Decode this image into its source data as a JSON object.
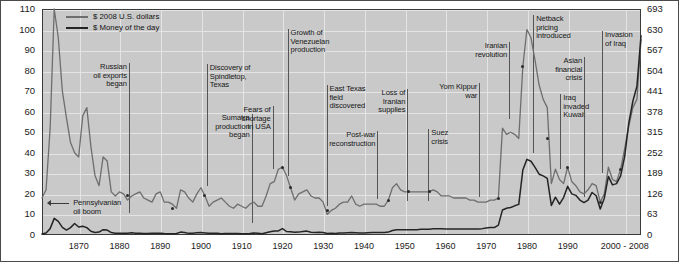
{
  "legend": {
    "position": "top-left-inside",
    "items": [
      {
        "label": "$ 2008 U.S. dollars",
        "color": "#6e6e6e"
      },
      {
        "label": "$ Money of the day",
        "color": "#242424"
      }
    ]
  },
  "chart_data": {
    "type": "line",
    "title": "",
    "xlabel": "",
    "ylabel": "",
    "grid": true,
    "xlim": [
      1861,
      2008
    ],
    "ylim": [
      0,
      110
    ],
    "ylim_right": [
      0,
      693
    ],
    "left_axis": {
      "ticks": [
        0,
        10,
        20,
        30,
        40,
        50,
        60,
        70,
        80,
        90,
        100,
        110
      ],
      "unit": "$ per barrel (2008 U.S. dollars)"
    },
    "right_axis": {
      "ticks": [
        0,
        63,
        126,
        189,
        252,
        315,
        378,
        441,
        504,
        567,
        630,
        693
      ],
      "unit": "index"
    },
    "x_tick_labels": [
      "1870",
      "1880",
      "1890",
      "1900",
      "1910",
      "1920",
      "1930",
      "1940",
      "1950",
      "1960",
      "1970",
      "1980",
      "1990",
      "2000 - 2008"
    ],
    "x_tick_values": [
      1870,
      1880,
      1890,
      1900,
      1910,
      1920,
      1930,
      1940,
      1950,
      1960,
      1970,
      1980,
      1990,
      2004
    ],
    "series": [
      {
        "name": "$ 2008 U.S. dollars",
        "color": "#6e6e6e",
        "x": [
          1861,
          1862,
          1863,
          1864,
          1865,
          1866,
          1867,
          1868,
          1869,
          1870,
          1871,
          1872,
          1873,
          1874,
          1875,
          1876,
          1877,
          1878,
          1879,
          1880,
          1881,
          1882,
          1883,
          1884,
          1885,
          1886,
          1887,
          1888,
          1889,
          1890,
          1891,
          1892,
          1893,
          1894,
          1895,
          1896,
          1897,
          1898,
          1899,
          1900,
          1901,
          1902,
          1903,
          1904,
          1905,
          1906,
          1907,
          1908,
          1909,
          1910,
          1911,
          1912,
          1913,
          1914,
          1915,
          1916,
          1917,
          1918,
          1919,
          1920,
          1921,
          1922,
          1923,
          1924,
          1925,
          1926,
          1927,
          1928,
          1929,
          1930,
          1931,
          1932,
          1933,
          1934,
          1935,
          1936,
          1937,
          1938,
          1939,
          1940,
          1941,
          1942,
          1943,
          1944,
          1945,
          1946,
          1947,
          1948,
          1949,
          1950,
          1951,
          1952,
          1953,
          1954,
          1955,
          1956,
          1957,
          1958,
          1959,
          1960,
          1961,
          1962,
          1963,
          1964,
          1965,
          1966,
          1967,
          1968,
          1969,
          1970,
          1971,
          1972,
          1973,
          1974,
          1975,
          1976,
          1977,
          1978,
          1979,
          1980,
          1981,
          1982,
          1983,
          1984,
          1985,
          1986,
          1987,
          1988,
          1989,
          1990,
          1991,
          1992,
          1993,
          1994,
          1995,
          1996,
          1997,
          1998,
          1999,
          2000,
          2001,
          2002,
          2003,
          2004,
          2005,
          2006,
          2007,
          2008
        ],
        "y": [
          18,
          22,
          52,
          110,
          96,
          70,
          57,
          45,
          40,
          38,
          58,
          62,
          43,
          29,
          24,
          38,
          36,
          21,
          19,
          21,
          20,
          17,
          19,
          20,
          21,
          18,
          17,
          16,
          20,
          21,
          16,
          16,
          15,
          13,
          22,
          21,
          18,
          16,
          20,
          23,
          19,
          14,
          16,
          17,
          18,
          16,
          14,
          13,
          15,
          14,
          13,
          15,
          16,
          14,
          14,
          19,
          25,
          26,
          32,
          33,
          29,
          23,
          17,
          20,
          21,
          22,
          19,
          18,
          18,
          16,
          10,
          12,
          13,
          15,
          16,
          16,
          19,
          15,
          14,
          15,
          15,
          15,
          15,
          14,
          14,
          17,
          23,
          25,
          22,
          21,
          21,
          21,
          21,
          21,
          21,
          21,
          22,
          21,
          19,
          19,
          19,
          18,
          18,
          18,
          18,
          17,
          17,
          16,
          16,
          16,
          17,
          17,
          18,
          52,
          49,
          50,
          49,
          47,
          82,
          100,
          96,
          85,
          73,
          66,
          62,
          25,
          32,
          27,
          25,
          33,
          26,
          24,
          21,
          20,
          22,
          25,
          24,
          16,
          20,
          33,
          27,
          26,
          32,
          42,
          53,
          62,
          66,
          95
        ],
        "peaks": {
          "1864": 110,
          "1872": 62,
          "1920": 33,
          "1980": 100,
          "2008": 95
        }
      },
      {
        "name": "$ Money of the day",
        "color": "#242424",
        "x": [
          1861,
          1862,
          1863,
          1864,
          1865,
          1866,
          1867,
          1868,
          1869,
          1870,
          1871,
          1872,
          1873,
          1874,
          1875,
          1876,
          1877,
          1878,
          1879,
          1880,
          1881,
          1882,
          1883,
          1884,
          1885,
          1886,
          1887,
          1888,
          1889,
          1890,
          1891,
          1892,
          1893,
          1894,
          1895,
          1896,
          1897,
          1898,
          1899,
          1900,
          1901,
          1902,
          1903,
          1904,
          1905,
          1906,
          1907,
          1908,
          1909,
          1910,
          1911,
          1912,
          1913,
          1914,
          1915,
          1916,
          1917,
          1918,
          1919,
          1920,
          1921,
          1922,
          1923,
          1924,
          1925,
          1926,
          1927,
          1928,
          1929,
          1930,
          1931,
          1932,
          1933,
          1934,
          1935,
          1936,
          1937,
          1938,
          1939,
          1940,
          1941,
          1942,
          1943,
          1944,
          1945,
          1946,
          1947,
          1948,
          1949,
          1950,
          1951,
          1952,
          1953,
          1954,
          1955,
          1956,
          1957,
          1958,
          1959,
          1960,
          1961,
          1962,
          1963,
          1964,
          1965,
          1966,
          1967,
          1968,
          1969,
          1970,
          1971,
          1972,
          1973,
          1974,
          1975,
          1976,
          1977,
          1978,
          1979,
          1980,
          1981,
          1982,
          1983,
          1984,
          1985,
          1986,
          1987,
          1988,
          1989,
          1990,
          1991,
          1992,
          1993,
          1994,
          1995,
          1996,
          1997,
          1998,
          1999,
          2000,
          2001,
          2002,
          2003,
          2004,
          2005,
          2006,
          2007,
          2008
        ],
        "y": [
          0.5,
          1.0,
          3.1,
          8.1,
          6.6,
          3.7,
          2.4,
          3.6,
          5.6,
          3.9,
          4.3,
          3.6,
          1.8,
          1.2,
          1.4,
          2.6,
          2.4,
          1.2,
          0.9,
          0.9,
          0.9,
          0.8,
          1.1,
          0.8,
          0.9,
          0.7,
          0.7,
          0.9,
          0.9,
          0.9,
          0.7,
          0.6,
          0.6,
          0.7,
          1.4,
          1.2,
          0.8,
          0.9,
          1.1,
          1.2,
          1.0,
          0.8,
          0.9,
          0.9,
          0.6,
          0.7,
          0.7,
          0.7,
          0.7,
          0.6,
          0.6,
          0.7,
          1.0,
          0.8,
          0.6,
          1.1,
          1.6,
          2.0,
          2.0,
          3.1,
          1.7,
          1.6,
          1.3,
          1.4,
          1.7,
          1.9,
          1.3,
          1.2,
          1.3,
          1.2,
          0.7,
          0.9,
          0.7,
          1.0,
          1.0,
          1.1,
          1.2,
          1.1,
          1.0,
          1.0,
          1.1,
          1.2,
          1.2,
          1.2,
          1.2,
          1.4,
          2.2,
          2.6,
          2.5,
          2.5,
          2.5,
          2.5,
          2.6,
          2.8,
          2.8,
          2.8,
          3.0,
          3.0,
          3.0,
          2.9,
          2.9,
          2.9,
          2.9,
          2.9,
          2.9,
          2.9,
          2.9,
          2.9,
          3.1,
          3.4,
          3.6,
          3.6,
          4.8,
          12.2,
          13.0,
          13.4,
          14.2,
          14.9,
          31.6,
          36.8,
          35.9,
          32.9,
          29.6,
          28.8,
          27.6,
          14.4,
          18.4,
          15.0,
          18.2,
          23.7,
          20.0,
          19.3,
          17.0,
          15.8,
          17.0,
          20.7,
          19.1,
          12.7,
          17.9,
          28.5,
          24.4,
          25.0,
          28.8,
          38.3,
          54.5,
          65.1,
          72.4,
          97.0
        ],
        "peaks": {
          "1980": 36.8,
          "2008": 97.0
        }
      }
    ],
    "annotations": [
      {
        "id": "pennsylvanian-oil-boom",
        "text": "Pennsylvanian\noil boom",
        "year": 1862,
        "align": "left",
        "style": "arrow",
        "x_pct": 4.7,
        "y_px": 198,
        "arrow_x_pct": 1.5,
        "arrow_y_px": 202
      },
      {
        "id": "russian-oil-exports-began",
        "text": "Russian\noil exports\nbegan",
        "year": 1882,
        "align": "right",
        "x_pct": 14.5,
        "y_px": 62,
        "leader_top": 62,
        "leader_bottom": 212
      },
      {
        "id": "sumatra-production-began",
        "text": "Sumatra\nproduction\nbegan",
        "year": 1893,
        "align": "right",
        "x_pct": 35.0,
        "y_px": 113,
        "leader_top": 113,
        "leader_bottom": 222
      },
      {
        "id": "discovery-of-spindletop-texas",
        "text": "Discovery of\nSpindletop,\nTexas",
        "year": 1901,
        "align": "left",
        "x_pct": 27.5,
        "y_px": 63,
        "leader_top": 63,
        "leader_bottom": 185
      },
      {
        "id": "fears-of-shortage-in-usa",
        "text": "Fears of\nshortage\nin USA",
        "year": 1920,
        "align": "right",
        "x_pct": 38.5,
        "y_px": 105,
        "leader_top": 105,
        "leader_bottom": 168
      },
      {
        "id": "growth-of-venezuelan-production",
        "text": "Growth of\nVenezuelan\nproduction",
        "year": 1922,
        "align": "left",
        "x_pct": 41.0,
        "y_px": 28,
        "leader_top": 28,
        "leader_bottom": 175
      },
      {
        "id": "east-texas-field-discovered",
        "text": "East Texas\nfield\ndiscovered",
        "year": 1931,
        "align": "left",
        "x_pct": 47.5,
        "y_px": 84,
        "leader_top": 84,
        "leader_bottom": 205
      },
      {
        "id": "post-war-reconstruction",
        "text": "Post-war\nreconstruction",
        "year": 1946,
        "align": "right",
        "x_pct": 56.0,
        "y_px": 130,
        "leader_top": 130,
        "leader_bottom": 198
      },
      {
        "id": "loss-of-iranian-supplies",
        "text": "Loss of\nIranian\nsupplies",
        "year": 1951,
        "align": "right",
        "x_pct": 61.0,
        "y_px": 88,
        "leader_top": 88,
        "leader_bottom": 200
      },
      {
        "id": "suez-crisis",
        "text": "Suez\ncrisis",
        "year": 1956,
        "align": "left",
        "x_pct": 64.5,
        "y_px": 128,
        "leader_top": 128,
        "leader_bottom": 200
      },
      {
        "id": "yom-kippur-war",
        "text": "Yom Kippur\nwar",
        "year": 1973,
        "align": "right",
        "x_pct": 73.0,
        "y_px": 82,
        "leader_top": 82,
        "leader_bottom": 196
      },
      {
        "id": "iranian-revolution",
        "text": "Iranian\nrevolution",
        "year": 1979,
        "align": "right",
        "x_pct": 78.0,
        "y_px": 41,
        "leader_top": 41,
        "leader_bottom": 118
      },
      {
        "id": "netback-pricing-introduced",
        "text": "Netback\npricing\nintroduced",
        "year": 1985,
        "align": "left",
        "x_pct": 82.0,
        "y_px": 14,
        "leader_top": 14,
        "leader_bottom": 152
      },
      {
        "id": "iraq-invaded-kuwait",
        "text": "Iraq\ninvaded\nKuwait",
        "year": 1990,
        "align": "left",
        "x_pct": 86.5,
        "y_px": 93,
        "leader_top": 93,
        "leader_bottom": 168
      },
      {
        "id": "asian-financial-crisis",
        "text": "Asian\nfinancial\ncrisis",
        "year": 1998,
        "align": "right",
        "x_pct": 90.5,
        "y_px": 56,
        "leader_top": 56,
        "leader_bottom": 196
      },
      {
        "id": "invasion-of-iraq",
        "text": "Invasion\nof Iraq",
        "year": 2003,
        "align": "left",
        "x_pct": 93.5,
        "y_px": 30,
        "leader_top": 30,
        "leader_bottom": 172
      }
    ],
    "markers": [
      {
        "year": 1882,
        "value": 19
      },
      {
        "year": 1893,
        "value": 13
      },
      {
        "year": 1901,
        "value": 19
      },
      {
        "year": 1920,
        "value": 33
      },
      {
        "year": 1922,
        "value": 23
      },
      {
        "year": 1931,
        "value": 12
      },
      {
        "year": 1946,
        "value": 17
      },
      {
        "year": 1951,
        "value": 21
      },
      {
        "year": 1956,
        "value": 21
      },
      {
        "year": 1973,
        "value": 18
      },
      {
        "year": 1979,
        "value": 82
      },
      {
        "year": 1985,
        "value": 47
      },
      {
        "year": 1990,
        "value": 33
      },
      {
        "year": 1998,
        "value": 16
      },
      {
        "year": 2003,
        "value": 32
      }
    ]
  }
}
